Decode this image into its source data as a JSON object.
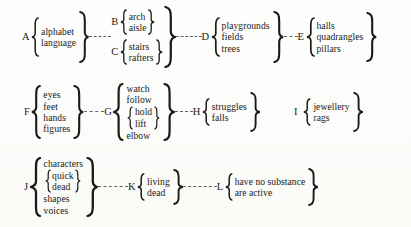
{
  "diagram": {
    "type": "brace-bracket-tree",
    "rows": [
      {
        "id": "row-1",
        "groups": [
          {
            "label": "A",
            "items": [
              "alphabet",
              "language"
            ]
          },
          {
            "label": "B",
            "items": [
              "arch",
              "aisle"
            ]
          },
          {
            "label": "C",
            "items": [
              "stairs",
              "rafters"
            ]
          },
          {
            "label": "D",
            "items": [
              "playgrounds",
              "fields",
              "trees"
            ]
          },
          {
            "label": "E",
            "items": [
              "halls",
              "quadrangles",
              "pillars"
            ]
          }
        ]
      },
      {
        "id": "row-2",
        "groups": [
          {
            "label": "F",
            "items": [
              "eyes",
              "feet",
              "hands",
              "figures"
            ]
          },
          {
            "label": "G",
            "items": [
              "watch",
              "follow",
              "hold",
              "lift",
              "elbow"
            ],
            "nested": [
              "hold",
              "lift"
            ]
          },
          {
            "label": "H",
            "items": [
              "struggles",
              "falls"
            ]
          },
          {
            "label": "I",
            "items": [
              "jewellery",
              "rags"
            ]
          }
        ]
      },
      {
        "id": "row-3",
        "groups": [
          {
            "label": "J",
            "items": [
              "characters",
              "quick",
              "dead",
              "shapes",
              "voices"
            ],
            "nested": [
              "quick",
              "dead"
            ]
          },
          {
            "label": "K",
            "items": [
              "living",
              "dead"
            ]
          },
          {
            "label": "L",
            "items": [
              "have no substance",
              "are active"
            ]
          }
        ]
      }
    ],
    "labels": {
      "A": "A",
      "B": "B",
      "C": "C",
      "D": "D",
      "E": "E",
      "F": "F",
      "G": "G",
      "H": "H",
      "I": "I",
      "J": "J",
      "K": "K",
      "L": "L"
    },
    "text": {
      "alphabet": "alphabet",
      "language": "language",
      "arch": "arch",
      "aisle": "aisle",
      "stairs": "stairs",
      "rafters": "rafters",
      "playgrounds": "playgrounds",
      "fields": "fields",
      "trees": "trees",
      "halls": "halls",
      "quadrangles": "quadrangles",
      "pillars": "pillars",
      "eyes": "eyes",
      "feet": "feet",
      "hands": "hands",
      "figures": "figures",
      "watch": "watch",
      "follow": "follow",
      "hold": "hold",
      "lift": "lift",
      "elbow": "elbow",
      "struggles": "struggles",
      "falls": "falls",
      "jewellery": "jewellery",
      "rags": "rags",
      "characters": "characters",
      "quick": "quick",
      "dead": "dead",
      "shapes": "shapes",
      "voices": "voices",
      "living": "living",
      "dead2": "dead",
      "have_no_substance": "have no substance",
      "are_active": "are active"
    },
    "colors": {
      "ink": "#1a1a18",
      "paper": "#fdfdfb",
      "connector": "#4a4a46"
    }
  }
}
